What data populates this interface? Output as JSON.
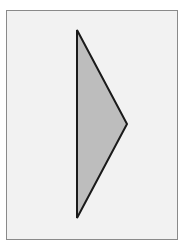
{
  "diagram": {
    "frame": {
      "x": 6,
      "y": 10,
      "width": 172,
      "height": 230,
      "fill": "#f2f2f2",
      "stroke": "#8a8a8a"
    },
    "shape": {
      "type": "triangle",
      "vertices": [
        [
          77,
          30
        ],
        [
          127,
          124
        ],
        [
          77,
          218
        ]
      ],
      "fill": "#bdbdbd",
      "stroke": "#1a1a1a"
    }
  }
}
